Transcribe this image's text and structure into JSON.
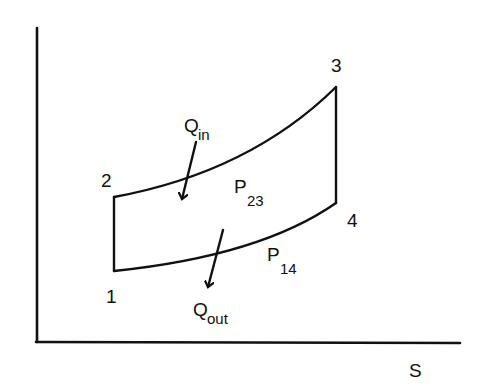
{
  "diagram": {
    "type": "T-s diagram (Brayton cycle)",
    "axes": {
      "x_label": "S",
      "y_label": ""
    },
    "states": [
      {
        "id": "1",
        "label": "1"
      },
      {
        "id": "2",
        "label": "2"
      },
      {
        "id": "3",
        "label": "3"
      },
      {
        "id": "4",
        "label": "4"
      }
    ],
    "isobars": {
      "high": {
        "main": "P",
        "sub": "23"
      },
      "low": {
        "main": "P",
        "sub": "14"
      }
    },
    "heat": {
      "in": {
        "main": "Q",
        "sub": "in"
      },
      "out": {
        "main": "Q",
        "sub": "out"
      }
    },
    "colors": {
      "line": "#111111",
      "background": "#ffffff"
    }
  }
}
